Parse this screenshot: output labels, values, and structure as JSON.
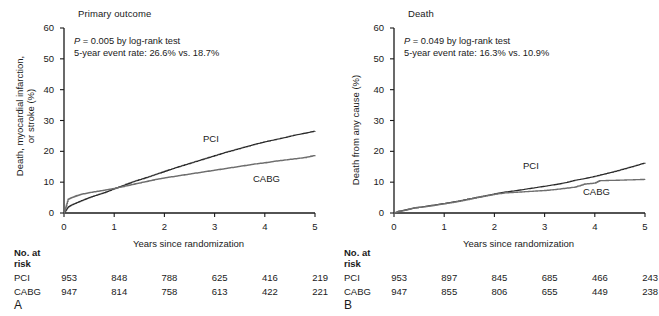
{
  "figure": {
    "panels": [
      {
        "letter": "A",
        "title": "Primary outcome",
        "ylabel_line1": "Death, myocardial infarction,",
        "ylabel_line2": "or stroke (%)",
        "xlabel": "Years since randomization",
        "annotation_line1_p": "P",
        "annotation_line1_rest": " = 0.005 by log-rank test",
        "annotation_line2": "5-year event rate: 26.6% vs. 18.7%",
        "curve_label_pci": "PCI",
        "curve_label_cabg": "CABG",
        "risk_heading_line1": "No. at",
        "risk_heading_line2": "risk",
        "risk_row_pci_label": "PCI",
        "risk_row_cabg_label": "CABG",
        "risk_pci": [
          "953",
          "848",
          "788",
          "625",
          "416",
          "219"
        ],
        "risk_cabg": [
          "947",
          "814",
          "758",
          "613",
          "422",
          "221"
        ]
      },
      {
        "letter": "B",
        "title": "Death",
        "ylabel_line1": "Death from any cause (%)",
        "ylabel_line2": "",
        "xlabel": "Years since randomization",
        "annotation_line1_p": "P",
        "annotation_line1_rest": " = 0.049 by log-rank test",
        "annotation_line2": "5-year event rate: 16.3% vs. 10.9%",
        "curve_label_pci": "PCI",
        "curve_label_cabg": "CABG",
        "risk_heading_line1": "No. at",
        "risk_heading_line2": "risk",
        "risk_row_pci_label": "PCI",
        "risk_row_cabg_label": "CABG",
        "risk_pci": [
          "953",
          "897",
          "845",
          "685",
          "466",
          "243"
        ],
        "risk_cabg": [
          "947",
          "855",
          "806",
          "655",
          "449",
          "238"
        ]
      }
    ],
    "axis": {
      "y_ticks": [
        "60",
        "50",
        "40",
        "30",
        "20",
        "10",
        "0"
      ],
      "x_ticks": [
        "0",
        "1",
        "2",
        "3",
        "4",
        "5"
      ]
    },
    "colors": {
      "axis": "#1a1a1a",
      "pci": "#2b2b2b",
      "cabg": "#6e6e6e",
      "text": "#1a1a1a",
      "background": "#ffffff"
    }
  },
  "chart_data": [
    {
      "type": "line",
      "title": "Primary outcome",
      "subtitle": "P = 0.005 by log-rank test; 5-year event rate: 26.6% vs. 18.7%",
      "xlabel": "Years since randomization",
      "ylabel": "Death, myocardial infarction, or stroke (%)",
      "xlim": [
        0,
        5
      ],
      "ylim": [
        0,
        60
      ],
      "xticks": [
        0,
        1,
        2,
        3,
        4,
        5
      ],
      "yticks": [
        0,
        10,
        20,
        30,
        40,
        50,
        60
      ],
      "grid": false,
      "legend": "inline-curve-labels",
      "series": [
        {
          "name": "PCI",
          "x": [
            0,
            0.08,
            0.15,
            0.25,
            0.35,
            0.5,
            0.65,
            0.8,
            1.0,
            1.2,
            1.4,
            1.6,
            1.8,
            2.0,
            2.2,
            2.4,
            2.6,
            2.8,
            3.0,
            3.2,
            3.4,
            3.6,
            3.8,
            4.0,
            4.2,
            4.4,
            4.6,
            4.8,
            5.0
          ],
          "y": [
            0,
            1.9,
            2.6,
            3.3,
            4.0,
            5.0,
            5.8,
            6.6,
            7.9,
            9.1,
            10.3,
            11.3,
            12.4,
            13.5,
            14.6,
            15.6,
            16.6,
            17.6,
            18.6,
            19.6,
            20.5,
            21.4,
            22.3,
            23.1,
            23.8,
            24.5,
            25.3,
            25.9,
            26.6
          ]
        },
        {
          "name": "CABG",
          "x": [
            0,
            0.08,
            0.15,
            0.25,
            0.35,
            0.5,
            0.65,
            0.8,
            1.0,
            1.2,
            1.4,
            1.6,
            1.8,
            2.0,
            2.2,
            2.4,
            2.6,
            2.8,
            3.0,
            3.2,
            3.4,
            3.6,
            3.8,
            4.0,
            4.2,
            4.4,
            4.6,
            4.8,
            5.0
          ],
          "y": [
            0,
            4.4,
            5.0,
            5.6,
            6.1,
            6.6,
            7.0,
            7.4,
            8.0,
            8.7,
            9.4,
            10.1,
            10.8,
            11.4,
            11.9,
            12.4,
            12.9,
            13.4,
            13.9,
            14.4,
            14.9,
            15.4,
            15.9,
            16.3,
            16.8,
            17.2,
            17.6,
            18.0,
            18.7
          ]
        }
      ]
    },
    {
      "type": "line",
      "title": "Death",
      "subtitle": "P = 0.049 by log-rank test; 5-year event rate: 16.3% vs. 10.9%",
      "xlabel": "Years since randomization",
      "ylabel": "Death from any cause (%)",
      "xlim": [
        0,
        5
      ],
      "ylim": [
        0,
        60
      ],
      "xticks": [
        0,
        1,
        2,
        3,
        4,
        5
      ],
      "yticks": [
        0,
        10,
        20,
        30,
        40,
        50,
        60
      ],
      "grid": false,
      "legend": "inline-curve-labels",
      "series": [
        {
          "name": "PCI",
          "x": [
            0,
            0.1,
            0.25,
            0.4,
            0.6,
            0.8,
            1.0,
            1.25,
            1.5,
            1.75,
            2.0,
            2.2,
            2.4,
            2.6,
            2.8,
            3.0,
            3.2,
            3.4,
            3.6,
            3.8,
            4.0,
            4.2,
            4.4,
            4.6,
            4.8,
            5.0
          ],
          "y": [
            0,
            0.6,
            1.1,
            1.6,
            2.1,
            2.6,
            3.1,
            3.8,
            4.6,
            5.4,
            6.2,
            6.8,
            7.2,
            7.7,
            8.2,
            8.7,
            9.2,
            9.8,
            10.6,
            11.2,
            11.9,
            12.7,
            13.5,
            14.4,
            15.3,
            16.3
          ]
        },
        {
          "name": "CABG",
          "x": [
            0,
            0.1,
            0.25,
            0.4,
            0.6,
            0.8,
            1.0,
            1.25,
            1.5,
            1.75,
            2.0,
            2.2,
            2.4,
            2.6,
            2.8,
            3.0,
            3.2,
            3.4,
            3.6,
            3.8,
            4.0,
            4.1,
            4.4,
            4.6,
            4.8,
            5.0
          ],
          "y": [
            0,
            0.5,
            1.0,
            1.7,
            2.0,
            2.5,
            3.0,
            3.7,
            4.5,
            5.3,
            6.1,
            6.5,
            6.7,
            6.9,
            7.1,
            7.3,
            7.6,
            8.0,
            8.4,
            9.4,
            9.7,
            10.5,
            10.6,
            10.7,
            10.8,
            10.9
          ]
        }
      ]
    }
  ]
}
